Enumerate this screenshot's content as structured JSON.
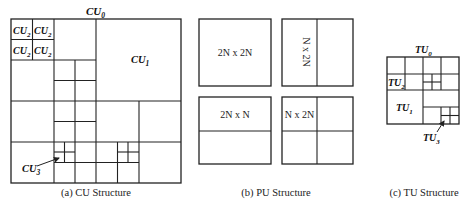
{
  "figure": {
    "panels": [
      {
        "id": "cu",
        "caption": "(a) CU Structure",
        "title": {
          "base": "CU",
          "sub": "0"
        },
        "labels": [
          {
            "base": "CU",
            "sub": "2"
          },
          {
            "base": "CU",
            "sub": "2"
          },
          {
            "base": "CU",
            "sub": "2"
          },
          {
            "base": "CU",
            "sub": "2"
          },
          {
            "base": "CU",
            "sub": "1"
          },
          {
            "base": "CU",
            "sub": "3"
          }
        ]
      },
      {
        "id": "pu",
        "caption": "(b) PU Structure",
        "partitions": [
          {
            "label": "2N x 2N"
          },
          {
            "label": "N x 2N"
          },
          {
            "label": "2N x N"
          },
          {
            "label": "N x 2N"
          }
        ]
      },
      {
        "id": "tu",
        "caption": "(c) TU Structure",
        "title": {
          "base": "TU",
          "sub": "0"
        },
        "labels": [
          {
            "base": "TU",
            "sub": "2"
          },
          {
            "base": "TU",
            "sub": "1"
          },
          {
            "base": "TU",
            "sub": "3"
          }
        ]
      }
    ]
  },
  "colors": {
    "line": "#222222",
    "background": "#ffffff"
  }
}
